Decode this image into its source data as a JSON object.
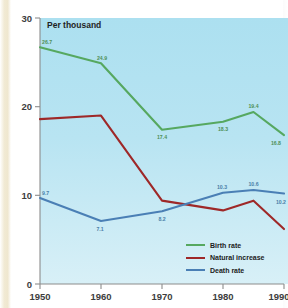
{
  "chart_data": {
    "type": "line",
    "title": "Per thousand",
    "xlabel": "",
    "ylabel": "",
    "xlim": [
      1950,
      1990
    ],
    "ylim": [
      0,
      30
    ],
    "yticks": [
      "0",
      "10",
      "20",
      "30"
    ],
    "ytick_values": [
      0,
      10,
      20,
      30
    ],
    "xticks": [
      "1950",
      "1960",
      "1970",
      "1980",
      "1990"
    ],
    "xtick_values": [
      1950,
      1960,
      1970,
      1980,
      1990
    ],
    "grid": false,
    "legend_position": "bottom-right",
    "x": [
      1950,
      1960,
      1970,
      1980,
      1985,
      1990
    ],
    "series": [
      {
        "name": "Birth rate",
        "color": "#56a860",
        "values": [
          26.7,
          24.9,
          17.4,
          18.3,
          19.4,
          16.8
        ],
        "labels": [
          "26.7",
          "24.9",
          "17.4",
          "18.3",
          "19.4",
          "16.8"
        ],
        "labels_shown": true
      },
      {
        "name": "Natural increase",
        "color": "#9e2828",
        "values": [
          18.6,
          19.0,
          9.4,
          8.3,
          9.4,
          6.2
        ],
        "labels": [
          "",
          "",
          "",
          "",
          "",
          ""
        ],
        "labels_shown": false
      },
      {
        "name": "Death rate",
        "color": "#4a7fb5",
        "values": [
          9.7,
          7.1,
          8.2,
          10.3,
          10.6,
          10.2
        ],
        "labels": [
          "9.7",
          "7.1",
          "8.2",
          "10.3",
          "10.6",
          "10.2"
        ],
        "labels_shown": true
      }
    ]
  },
  "axes": {
    "y": {
      "tick_0": "0",
      "tick_10": "10",
      "tick_20": "20",
      "tick_30": "30"
    },
    "x": {
      "tick_1950": "1950",
      "tick_1960": "1960",
      "tick_1970": "1970",
      "tick_1980": "1980",
      "tick_1990": "1990"
    }
  },
  "title": {
    "text": "Per thousand"
  },
  "legend": {
    "items": [
      {
        "label": "Birth rate",
        "color": "#56a860"
      },
      {
        "label": "Natural increase",
        "color": "#9e2828"
      },
      {
        "label": "Death rate",
        "color": "#4a7fb5"
      }
    ]
  },
  "data_labels": {
    "birth": [
      "26.7",
      "24.9",
      "17.4",
      "18.3",
      "19.4",
      "16.8"
    ],
    "death": [
      "9.7",
      "7.1",
      "8.2",
      "10.3",
      "10.6",
      "10.2"
    ]
  },
  "colors": {
    "birth_rate": "#56a860",
    "natural_increase": "#9e2828",
    "death_rate": "#4a7fb5",
    "plot_background_top": "#ace0f0",
    "plot_background_bottom": "#d8f0f7",
    "axis": "#8c8c8c"
  }
}
